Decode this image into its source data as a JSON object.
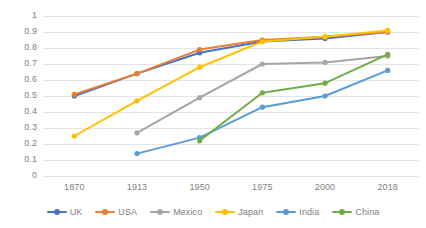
{
  "chart_data": {
    "type": "line",
    "title": "",
    "subtitle": "",
    "xlabel": "",
    "ylabel": "",
    "categories": [
      "1870",
      "1913",
      "1950",
      "1975",
      "2000",
      "2018"
    ],
    "x_tick_labels": [
      "1870",
      "1913",
      "1950",
      "1975",
      "2000",
      "2018"
    ],
    "y_tick_labels": [
      "1",
      "0.9",
      "0.8",
      "0.7",
      "0.6",
      "0.5",
      "0.4",
      "0.3",
      "0.2",
      "0.1",
      "0"
    ],
    "y_tick_values": [
      1,
      0.9,
      0.8,
      0.7,
      0.6,
      0.5,
      0.4,
      0.3,
      0.2,
      0.1,
      0
    ],
    "ylim": [
      0,
      1
    ],
    "grid": "horizontal",
    "legend_position": "bottom",
    "markers": true,
    "series": [
      {
        "name": "UK",
        "color": "#4472c4",
        "values": [
          0.5,
          0.64,
          0.77,
          0.84,
          0.86,
          0.9
        ]
      },
      {
        "name": "USA",
        "color": "#ed7d31",
        "values": [
          0.51,
          0.64,
          0.79,
          0.85,
          0.87,
          0.9
        ]
      },
      {
        "name": "Mexico",
        "color": "#a5a5a5",
        "values": [
          null,
          0.27,
          0.49,
          0.7,
          0.71,
          0.75
        ]
      },
      {
        "name": "Japan",
        "color": "#ffc000",
        "values": [
          0.25,
          0.47,
          0.68,
          0.84,
          0.87,
          0.91
        ]
      },
      {
        "name": "India",
        "color": "#5b9bd5",
        "values": [
          null,
          0.14,
          0.24,
          0.43,
          0.5,
          0.66
        ]
      },
      {
        "name": "China",
        "color": "#70ad47",
        "values": [
          null,
          null,
          0.22,
          0.52,
          0.58,
          0.76
        ]
      }
    ]
  },
  "legend": {
    "items": [
      {
        "label": "UK"
      },
      {
        "label": "USA"
      },
      {
        "label": "Mexico"
      },
      {
        "label": "Japan"
      },
      {
        "label": "India"
      },
      {
        "label": "China"
      }
    ]
  }
}
